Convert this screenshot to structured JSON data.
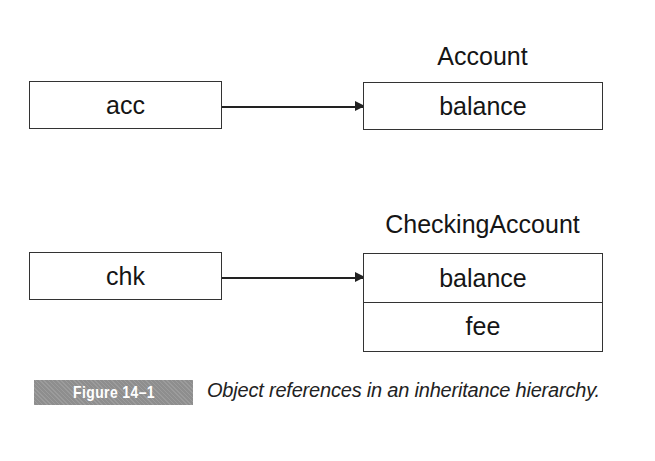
{
  "diagram": {
    "rows": [
      {
        "reference": "acc",
        "class_name": "Account",
        "fields": [
          "balance"
        ]
      },
      {
        "reference": "chk",
        "class_name": "CheckingAccount",
        "fields": [
          "balance",
          "fee"
        ]
      }
    ]
  },
  "figure": {
    "number_label": "Figure 14–1",
    "caption": "Object references in an inheritance hierarchy."
  },
  "colors": {
    "line": "#333333",
    "badge_bg": "#8e8e8e",
    "badge_text": "#ffffff"
  }
}
